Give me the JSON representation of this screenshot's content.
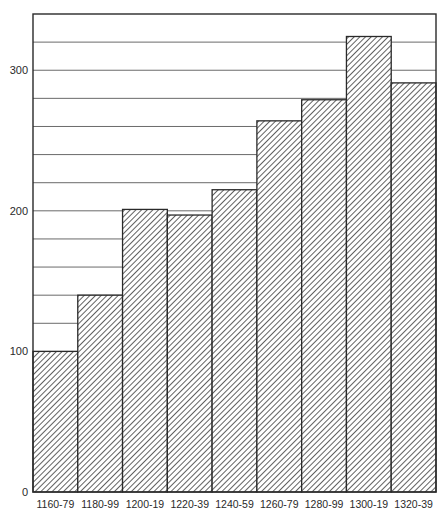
{
  "chart_data": {
    "type": "bar",
    "title": "",
    "xlabel": "",
    "ylabel": "",
    "categories": [
      "1160-79",
      "1180-99",
      "1200-19",
      "1220-39",
      "1240-59",
      "1260-79",
      "1280-99",
      "1300-19",
      "1320-39"
    ],
    "values": [
      100,
      140,
      201,
      197,
      215,
      264,
      279,
      324,
      291
    ],
    "ylim": [
      0,
      340
    ],
    "y_ticks": [
      0,
      100,
      200,
      300
    ],
    "y_tick_labels": [
      "0",
      "100",
      "200",
      "300"
    ],
    "grid": {
      "horizontal": true,
      "step": 20
    },
    "legend": null,
    "bar_style": {
      "fill": "diagonal-hatch",
      "edge_color": "#2a2a2a",
      "gap": 0
    },
    "colors": {
      "axis": "#2a2a2a",
      "grid": "#6a6a6a",
      "hatch": "#3a3a3a",
      "background": "#ffffff"
    }
  }
}
